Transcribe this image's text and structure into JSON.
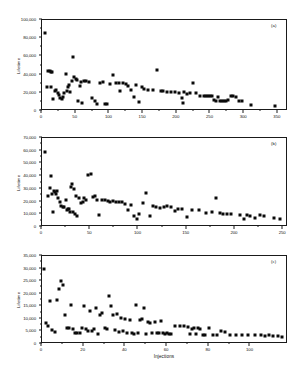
{
  "figure": {
    "background": "#ffffff",
    "marker_color": "#0a0a0a",
    "axis_color": "#1a1a1a"
  },
  "chart_data": [
    {
      "type": "scatter",
      "panel": "(a)",
      "title": "",
      "xlabel": "",
      "ylabel": "Lifetime",
      "xlim": [
        0,
        365
      ],
      "ylim": [
        0,
        100000
      ],
      "xticks": [
        0,
        50,
        100,
        150,
        200,
        250,
        300,
        350
      ],
      "xtick_labels": [
        "0",
        "50",
        "100",
        "150",
        "200",
        "250",
        "300",
        "350"
      ],
      "yticks": [
        0,
        20000,
        40000,
        60000,
        80000,
        100000
      ],
      "ytick_labels": [
        "0",
        "20,000",
        "40,000",
        "60,000",
        "80,000",
        "100,000"
      ],
      "grid": false,
      "legend": "none",
      "x": [
        4,
        8,
        9,
        12,
        13,
        14,
        15,
        17,
        19,
        21,
        23,
        25,
        27,
        29,
        31,
        33,
        35,
        37,
        38,
        40,
        42,
        44,
        46,
        48,
        50,
        52,
        54,
        56,
        58,
        60,
        63,
        66,
        70,
        74,
        78,
        82,
        86,
        90,
        94,
        97,
        101,
        105,
        110,
        114,
        116,
        120,
        124,
        128,
        132,
        136,
        140,
        144,
        148,
        152,
        158,
        164,
        170,
        176,
        180,
        186,
        192,
        198,
        203,
        207,
        209,
        211,
        215,
        219,
        224,
        229,
        234,
        240,
        243,
        246,
        249,
        252,
        255,
        258,
        261,
        264,
        267,
        270,
        273,
        276,
        280,
        284,
        288,
        292,
        297,
        310,
        345
      ],
      "y": [
        86000,
        26000,
        44000,
        43500,
        26500,
        43000,
        42500,
        13500,
        22000,
        23500,
        20000,
        18000,
        14500,
        13500,
        15000,
        20000,
        41000,
        22000,
        26000,
        29000,
        21000,
        33000,
        59000,
        37000,
        35000,
        34500,
        11000,
        27000,
        32000,
        8500,
        33000,
        32500,
        32000,
        14500,
        10500,
        7500,
        31000,
        32000,
        8000,
        7500,
        30000,
        40000,
        31000,
        30500,
        22000,
        30500,
        29500,
        28000,
        23000,
        15500,
        29000,
        10000,
        26000,
        24000,
        23500,
        23000,
        45000,
        22000,
        21500,
        21000,
        21000,
        20500,
        20000,
        14000,
        9000,
        21000,
        18500,
        20000,
        31000,
        19500,
        17000,
        16500,
        16500,
        16000,
        16500,
        16000,
        12500,
        11500,
        15500,
        11000,
        11000,
        11500,
        11500,
        12000,
        16000,
        16000,
        15000,
        11500,
        10500,
        7000,
        6000
      ]
    },
    {
      "type": "scatter",
      "panel": "(b)",
      "title": "",
      "xlabel": "",
      "ylabel": "Lifetime",
      "xlim": [
        0,
        255
      ],
      "ylim": [
        0,
        70000
      ],
      "xticks": [
        0,
        50,
        100,
        150,
        200,
        250
      ],
      "xtick_labels": [
        "0",
        "50",
        "100",
        "150",
        "200",
        "250"
      ],
      "yticks": [
        0,
        10000,
        20000,
        30000,
        40000,
        50000,
        60000,
        70000
      ],
      "ytick_labels": [
        "0",
        "10,000",
        "20,000",
        "30,000",
        "40,000",
        "50,000",
        "60,000",
        "70,000"
      ],
      "grid": false,
      "legend": "none",
      "x": [
        3,
        6,
        8,
        9,
        10,
        11,
        12,
        13,
        15,
        16,
        17,
        19,
        20,
        22,
        23,
        25,
        26,
        27,
        28,
        29,
        30,
        31,
        32,
        33,
        34,
        35,
        36,
        38,
        40,
        42,
        44,
        46,
        48,
        51,
        53,
        55,
        57,
        59,
        62,
        65,
        68,
        71,
        74,
        77,
        80,
        83,
        86,
        89,
        92,
        95,
        98,
        101,
        105,
        108,
        112,
        115,
        118,
        122,
        126,
        130,
        134,
        138,
        141,
        145,
        150,
        156,
        163,
        170,
        176,
        180,
        184,
        188,
        192,
        196,
        205,
        209,
        212,
        216,
        221,
        226,
        230,
        240,
        247
      ],
      "y": [
        59000,
        24500,
        31000,
        40000,
        26000,
        12000,
        28500,
        27500,
        26000,
        28000,
        23000,
        20000,
        16500,
        16000,
        15500,
        21000,
        13500,
        14500,
        14000,
        12000,
        31500,
        33500,
        12000,
        30000,
        10500,
        24000,
        8500,
        23000,
        18500,
        20000,
        22500,
        21000,
        41000,
        42000,
        23500,
        24000,
        21500,
        9500,
        21000,
        21500,
        20500,
        20000,
        20500,
        20000,
        19500,
        19500,
        18000,
        13000,
        17500,
        8500,
        6500,
        10000,
        18500,
        27000,
        8500,
        16500,
        16000,
        15000,
        15500,
        16500,
        15500,
        12500,
        14000,
        14000,
        8000,
        13500,
        13000,
        11000,
        11500,
        22500,
        11000,
        10000,
        10000,
        10000,
        9500,
        6500,
        9500,
        8500,
        7000,
        9500,
        9000,
        7000,
        6000
      ]
    },
    {
      "type": "scatter",
      "panel": "(c)",
      "title": "",
      "xlabel": "Injections",
      "ylabel": "Lifetime",
      "xlim": [
        0,
        118
      ],
      "ylim": [
        0,
        35000
      ],
      "xticks": [
        0,
        20,
        40,
        60,
        80,
        100
      ],
      "xtick_labels": [
        "0",
        "20",
        "40",
        "60",
        "80",
        "100"
      ],
      "yticks": [
        0,
        5000,
        10000,
        15000,
        20000,
        25000,
        30000,
        35000
      ],
      "ytick_labels": [
        "0",
        "5,000",
        "10,000",
        "15,000",
        "20,000",
        "25,000",
        "30,000",
        "35,000"
      ],
      "grid": false,
      "legend": "none",
      "x": [
        1,
        2,
        3,
        4,
        5,
        6,
        7,
        8,
        9,
        10,
        11,
        12,
        13,
        14,
        15,
        16,
        17,
        18,
        19,
        20,
        21,
        22,
        23,
        24,
        25,
        26,
        27,
        28,
        29,
        30,
        31,
        32,
        33,
        34,
        35,
        36,
        37,
        38,
        39,
        40,
        41,
        42,
        43,
        44,
        45,
        46,
        47,
        48,
        49,
        50,
        51,
        52,
        53,
        54,
        55,
        56,
        57,
        58,
        59,
        60,
        61,
        62,
        64,
        66,
        68,
        70,
        71,
        72,
        73,
        74,
        75,
        76,
        77,
        78,
        80,
        82,
        84,
        86,
        88,
        90,
        93,
        96,
        99,
        102,
        105,
        107,
        109,
        111,
        113,
        115
      ],
      "y": [
        30000,
        8500,
        7000,
        17000,
        5500,
        4800,
        17500,
        22000,
        25000,
        23500,
        11500,
        6200,
        6300,
        15500,
        5800,
        4500,
        4200,
        4300,
        6500,
        15000,
        6000,
        5200,
        13000,
        5300,
        5800,
        14500,
        4000,
        11500,
        12500,
        6500,
        5800,
        19000,
        15000,
        11500,
        5500,
        12000,
        4800,
        10500,
        5000,
        10000,
        4200,
        9500,
        4300,
        4000,
        15500,
        4200,
        9500,
        10000,
        14500,
        4000,
        8800,
        8500,
        4300,
        8700,
        4200,
        4300,
        9200,
        4300,
        4000,
        4200,
        4000,
        3800,
        7200,
        7000,
        7000,
        6800,
        3800,
        6000,
        6300,
        3800,
        6300,
        6000,
        3700,
        3600,
        6200,
        3600,
        3500,
        5000,
        4800,
        3500,
        3700,
        3600,
        3500,
        3400,
        3500,
        3300,
        3400,
        3200,
        3000,
        2600
      ]
    }
  ]
}
